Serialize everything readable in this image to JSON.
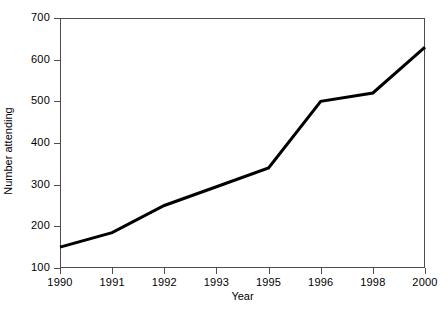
{
  "chart_data": {
    "type": "line",
    "title": "",
    "xlabel": "Year",
    "ylabel": "Number attending",
    "categories": [
      "1990",
      "1991",
      "1992",
      "1993",
      "1995",
      "1996",
      "1998",
      "2000"
    ],
    "values": [
      150,
      185,
      250,
      295,
      340,
      500,
      520,
      630
    ],
    "series": [
      {
        "name": "Number attending",
        "values": [
          150,
          185,
          250,
          295,
          340,
          500,
          520,
          630
        ],
        "color": "#000000",
        "line_width": 3,
        "markers": "none"
      }
    ],
    "yticks": [
      100,
      200,
      300,
      400,
      500,
      600,
      700
    ],
    "ytick_labels": [
      "100",
      "200",
      "300",
      "400",
      "500",
      "600",
      "700"
    ],
    "xtick_labels": [
      "1990",
      "1991",
      "1992",
      "1993",
      "1995",
      "1996",
      "1998",
      "2000"
    ],
    "ylim": [
      100,
      700
    ],
    "xlim_categorical": true,
    "grid": false,
    "legend": false,
    "legend_position": "none",
    "frame": "box",
    "axis_color": "#4d4d4d",
    "background": "#ffffff"
  }
}
